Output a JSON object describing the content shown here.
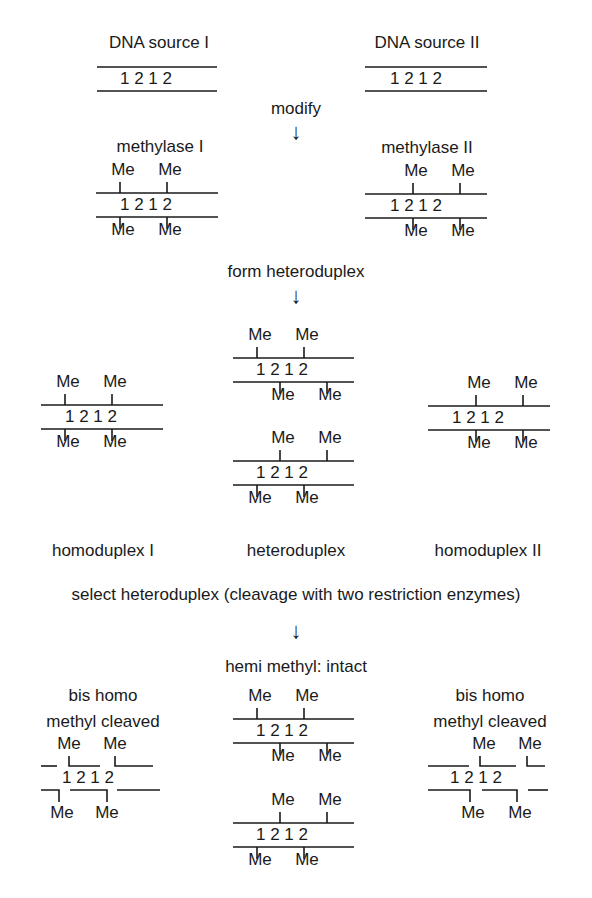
{
  "title_labels": {
    "source_1": "DNA source I",
    "source_2": "DNA source II",
    "modify": "modify",
    "methylase_1": "methylase I",
    "methylase_2": "methylase II",
    "form_heteroduplex": "form heteroduplex",
    "homoduplex_1": "homoduplex I",
    "heteroduplex": "heteroduplex",
    "homoduplex_2": "homoduplex II",
    "select": "select heteroduplex (cleavage with two restriction enzymes)",
    "hemi_methyl": "hemi methyl: intact",
    "bis_homo_1_line1": "bis homo",
    "bis_homo_1_line2": "methyl cleaved",
    "bis_homo_2_line1": "bis homo",
    "bis_homo_2_line2": "methyl cleaved"
  },
  "glyphs": {
    "arrow_down": "↓",
    "methyl": "Me",
    "sequence": "1 2 1 2"
  },
  "colors": {
    "ink": "#1a1a1a",
    "background": "#ffffff"
  },
  "duplexes": [
    {
      "id": "source-1",
      "x": 97,
      "y": 67,
      "w": 120,
      "top_me": [],
      "bottom_me": [],
      "digits_x": 120
    },
    {
      "id": "source-2",
      "x": 365,
      "y": 67,
      "w": 122,
      "top_me": [],
      "bottom_me": [],
      "digits_x": 390
    },
    {
      "id": "methylase-1",
      "x": 96,
      "y": 193,
      "w": 122,
      "top_me": [
        120,
        167
      ],
      "bottom_me": [
        120,
        167
      ],
      "digits_x": 120
    },
    {
      "id": "methylase-2",
      "x": 365,
      "y": 194,
      "w": 122,
      "top_me": [
        413,
        460
      ],
      "bottom_me": [
        413,
        460
      ],
      "digits_x": 390
    },
    {
      "id": "homoduplex-1",
      "x": 41,
      "y": 405,
      "w": 122,
      "top_me": [
        65,
        112
      ],
      "bottom_me": [
        65,
        112
      ],
      "digits_x": 65
    },
    {
      "id": "heteroduplex-a",
      "x": 233,
      "y": 358,
      "w": 121,
      "top_me": [
        257,
        304
      ],
      "bottom_me": [
        280,
        327
      ],
      "digits_x": 256
    },
    {
      "id": "heteroduplex-b",
      "x": 233,
      "y": 461,
      "w": 121,
      "top_me": [
        280,
        327
      ],
      "bottom_me": [
        257,
        304
      ],
      "digits_x": 256
    },
    {
      "id": "homoduplex-2",
      "x": 428,
      "y": 406,
      "w": 122,
      "top_me": [
        476,
        523
      ],
      "bottom_me": [
        476,
        523
      ],
      "digits_x": 452
    },
    {
      "id": "hemi-a",
      "x": 233,
      "y": 719,
      "w": 121,
      "top_me": [
        257,
        304
      ],
      "bottom_me": [
        280,
        327
      ],
      "digits_x": 256
    },
    {
      "id": "hemi-b",
      "x": 233,
      "y": 823,
      "w": 121,
      "top_me": [
        280,
        327
      ],
      "bottom_me": [
        257,
        304
      ],
      "digits_x": 256
    }
  ]
}
